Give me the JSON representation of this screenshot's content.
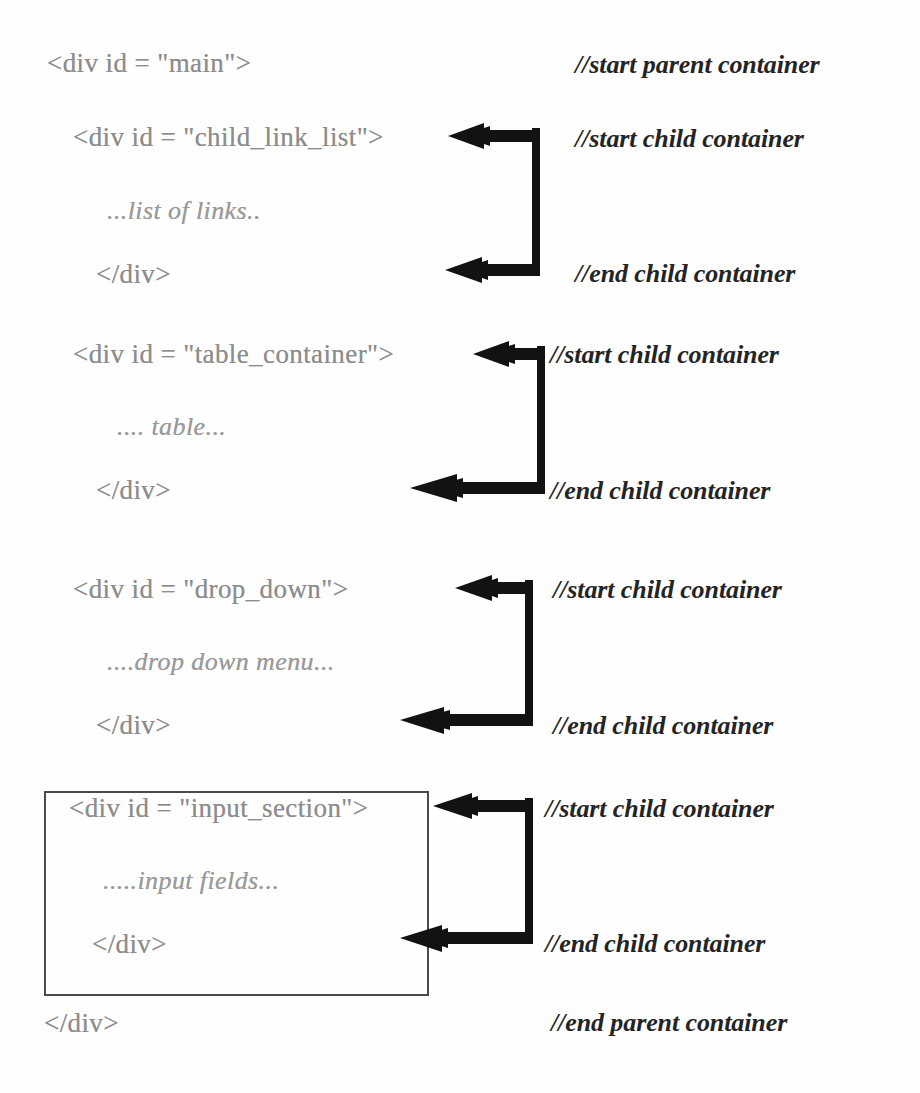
{
  "document": {
    "title": "HTML div container structure diagram",
    "background_color": "#fefefe",
    "code_text_color": "#8d8d8d",
    "comment_text_color": "#242424",
    "arrow_color": "#121212",
    "box_border_color": "#4a4a4a"
  },
  "lines": {
    "parent_open": "<div id = \"main\">",
    "parent_open_comment": "//start parent container",
    "parent_close": "</div>",
    "parent_close_comment": "//end parent container"
  },
  "blocks": [
    {
      "id": "child_link_list",
      "open_tag": "<div id = \"child_link_list\">",
      "body": "...list of links..",
      "close_tag": "</div>",
      "start_comment": "//start child container",
      "end_comment": "//end child container",
      "boxed": false
    },
    {
      "id": "table_container",
      "open_tag": "<div id = \"table_container\">",
      "body": ".... table...",
      "close_tag": "</div>",
      "start_comment": "//start child container",
      "end_comment": "//end child container",
      "boxed": false
    },
    {
      "id": "drop_down",
      "open_tag": "<div id = \"drop_down\">",
      "body": "....drop down menu...",
      "close_tag": "</div>",
      "start_comment": "//start child container",
      "end_comment": "//end child container",
      "boxed": false
    },
    {
      "id": "input_section",
      "open_tag": "<div id = \"input_section\">",
      "body": ".....input fields...",
      "close_tag": "</div>",
      "start_comment": "//start child container",
      "end_comment": "//end child container",
      "boxed": true
    }
  ]
}
